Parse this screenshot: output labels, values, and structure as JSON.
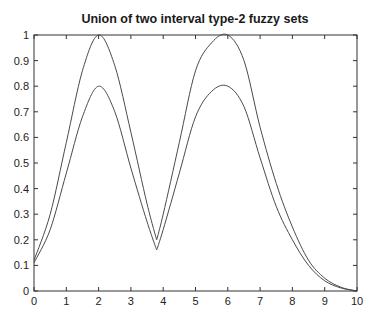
{
  "chart_data": {
    "type": "line",
    "title": "Union of two interval type-2 fuzzy sets",
    "xlabel": "",
    "ylabel": "",
    "xlim": [
      0,
      10
    ],
    "ylim": [
      0,
      1
    ],
    "xticks": [
      "0",
      "1",
      "2",
      "3",
      "4",
      "5",
      "6",
      "7",
      "8",
      "9",
      "10"
    ],
    "yticks": [
      "0",
      "0.1",
      "0.2",
      "0.3",
      "0.4",
      "0.5",
      "0.6",
      "0.7",
      "0.8",
      "0.9",
      "1"
    ],
    "grid": false,
    "legend": null,
    "x": [
      0,
      0.5,
      1,
      1.5,
      2,
      2.5,
      3,
      3.5,
      3.8,
      4,
      4.5,
      5,
      5.5,
      6,
      6.5,
      7,
      7.5,
      8,
      8.5,
      9,
      9.5,
      10
    ],
    "series": [
      {
        "name": "upper membership function",
        "values": [
          0.12,
          0.3,
          0.58,
          0.86,
          1.0,
          0.88,
          0.62,
          0.34,
          0.2,
          0.3,
          0.58,
          0.86,
          0.97,
          1.0,
          0.9,
          0.64,
          0.42,
          0.25,
          0.12,
          0.05,
          0.015,
          0.0
        ]
      },
      {
        "name": "lower membership function",
        "values": [
          0.11,
          0.24,
          0.46,
          0.68,
          0.8,
          0.7,
          0.48,
          0.27,
          0.16,
          0.24,
          0.46,
          0.68,
          0.78,
          0.8,
          0.72,
          0.52,
          0.33,
          0.2,
          0.1,
          0.04,
          0.012,
          0.0
        ]
      }
    ]
  },
  "colors": {
    "line": "#4a4a4a",
    "axis": "#333333"
  }
}
